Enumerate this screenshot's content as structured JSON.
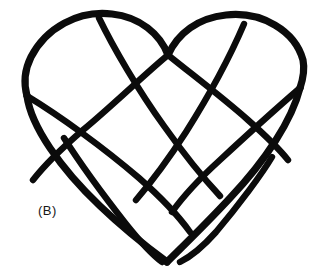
{
  "figure": {
    "kind": "line-drawing",
    "label": "(B)",
    "background_color": "#ffffff",
    "ink_color": "#0b0b0b",
    "stroke_width_outline": 7.2,
    "stroke_width_weave": 6.4,
    "canvas": {
      "width": 325,
      "height": 273
    },
    "paths": {
      "outline_left_lobe": "M168,55 C160,34 140,17 112,14 C78,10 46,28 31,57 C24,71 24,85 27,96",
      "outline_left_side": "M27,96 C31,126 60,168 100,206 C126,231 151,250 167,262",
      "outline_right_lobe": "M168,55 C178,33 198,18 226,15 C262,11 295,31 303,60 C305,70 303,79 300,88",
      "outline_right_side": "M300,88 C292,120 266,160 230,198 C204,226 180,249 167,262",
      "weave_cleft_to_left": "M168,55 C146,73 112,106 83,130 C62,148 44,166 33,180",
      "weave_cleft_to_right": "M168,55 C194,76 222,97 248,120 C266,136 280,150 288,160",
      "weave_left_edge_diagonal": "M27,96 C60,116 104,148 139,178 C164,200 180,218 190,232",
      "weave_right_edge_diagonal": "M300,88 C278,107 248,134 220,160 C198,180 182,198 172,212",
      "weave_left_inner_band": "M64,138 C78,160 104,196 126,224 C142,244 154,256 162,262",
      "weave_right_inner_band": "M272,157 C262,174 238,206 216,232 C200,250 188,258 180,262",
      "weave_upper_left_band": "M99,18 C113,47 138,90 164,126 C186,157 206,181 220,196",
      "weave_upper_right_band": "M244,24 C232,52 210,94 186,132 C166,163 148,186 136,200"
    }
  }
}
